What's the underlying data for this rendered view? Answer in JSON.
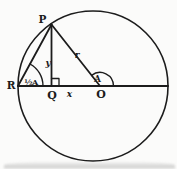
{
  "figure": {
    "points": {
      "p": "P",
      "r_point": "R",
      "q": "Q",
      "o": "O"
    },
    "lengths": {
      "vertical": "y",
      "horizontal": "x",
      "radius": "r"
    },
    "angles": {
      "at_center": "A",
      "at_circumference": "½A"
    }
  },
  "colors": {
    "ink": "#1c1c1c",
    "paper": "#fbfbfa",
    "scan_shadow": "#9a9a9a"
  }
}
